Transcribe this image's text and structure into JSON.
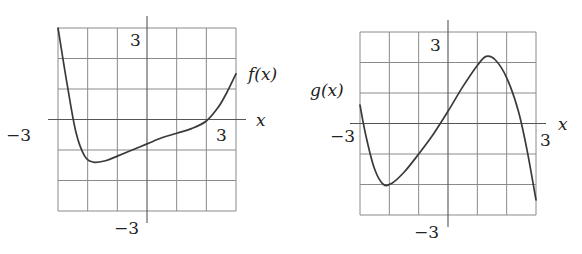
{
  "graphs": [
    {
      "id": "f",
      "function_label": "f(x)",
      "axis_label_x": "x",
      "tick_pos_y": "3",
      "tick_neg_y": "−3",
      "tick_neg_x": "−3",
      "tick_pos_x": "3",
      "grid": {
        "xmin": -3,
        "xmax": 3,
        "ymin": -3,
        "ymax": 3,
        "step": 1
      },
      "px": {
        "left": 58,
        "right": 236,
        "top": 28,
        "bottom": 211
      },
      "curve": [
        [
          -3,
          3
        ],
        [
          -2.7,
          1.2
        ],
        [
          -2.4,
          -0.4
        ],
        [
          -2.1,
          -1.2
        ],
        [
          -1.8,
          -1.4
        ],
        [
          -1.4,
          -1.35
        ],
        [
          -1,
          -1.2
        ],
        [
          -0.5,
          -1.0
        ],
        [
          0,
          -0.8
        ],
        [
          0.5,
          -0.6
        ],
        [
          1,
          -0.45
        ],
        [
          1.5,
          -0.3
        ],
        [
          2,
          -0.05
        ],
        [
          2.4,
          0.4
        ],
        [
          2.7,
          0.9
        ],
        [
          3,
          1.5
        ]
      ]
    },
    {
      "id": "g",
      "function_label": "g(x)",
      "axis_label_x": "x",
      "tick_pos_y": "3",
      "tick_neg_y": "−3",
      "tick_neg_x": "−3",
      "tick_pos_x": "3",
      "grid": {
        "xmin": -3,
        "xmax": 3,
        "ymin": -3,
        "ymax": 3,
        "step": 1
      },
      "px": {
        "left": 360,
        "right": 536,
        "top": 32,
        "bottom": 215
      },
      "curve": [
        [
          -3,
          0.6
        ],
        [
          -2.8,
          -0.4
        ],
        [
          -2.5,
          -1.5
        ],
        [
          -2.2,
          -2.0
        ],
        [
          -1.9,
          -1.95
        ],
        [
          -1.5,
          -1.6
        ],
        [
          -1,
          -1.0
        ],
        [
          -0.5,
          -0.35
        ],
        [
          0,
          0.4
        ],
        [
          0.5,
          1.2
        ],
        [
          1,
          1.9
        ],
        [
          1.3,
          2.2
        ],
        [
          1.6,
          2.1
        ],
        [
          2,
          1.5
        ],
        [
          2.4,
          0.4
        ],
        [
          2.7,
          -0.9
        ],
        [
          3,
          -2.5
        ]
      ]
    }
  ],
  "chart_data": [
    {
      "type": "line",
      "title": "f(x)",
      "xlabel": "x",
      "ylabel": "f(x)",
      "xlim": [
        -3,
        3
      ],
      "ylim": [
        -3,
        3
      ],
      "grid": true,
      "tick_labels": {
        "x": [
          "−3",
          "3"
        ],
        "y": [
          "3",
          "−3"
        ]
      },
      "x": [
        -3,
        -2.7,
        -2.4,
        -2.1,
        -1.8,
        -1.4,
        -1,
        -0.5,
        0,
        0.5,
        1,
        1.5,
        2,
        2.4,
        2.7,
        3
      ],
      "y": [
        3,
        1.2,
        -0.4,
        -1.2,
        -1.4,
        -1.35,
        -1.2,
        -1.0,
        -0.8,
        -0.6,
        -0.45,
        -0.3,
        -0.05,
        0.4,
        0.9,
        1.5
      ]
    },
    {
      "type": "line",
      "title": "g(x)",
      "xlabel": "x",
      "ylabel": "g(x)",
      "xlim": [
        -3,
        3
      ],
      "ylim": [
        -3,
        3
      ],
      "grid": true,
      "tick_labels": {
        "x": [
          "−3",
          "3"
        ],
        "y": [
          "3",
          "−3"
        ]
      },
      "x": [
        -3,
        -2.8,
        -2.5,
        -2.2,
        -1.9,
        -1.5,
        -1,
        -0.5,
        0,
        0.5,
        1,
        1.3,
        1.6,
        2,
        2.4,
        2.7,
        3
      ],
      "y": [
        0.6,
        -0.4,
        -1.5,
        -2.0,
        -1.95,
        -1.6,
        -1.0,
        -0.35,
        0.4,
        1.2,
        1.9,
        2.2,
        2.1,
        1.5,
        0.4,
        -0.9,
        -2.5
      ]
    }
  ]
}
